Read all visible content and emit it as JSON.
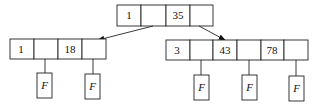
{
  "diagram": {
    "type": "tree",
    "root": {
      "keys": [
        "1",
        "",
        "35",
        ""
      ]
    },
    "children": [
      {
        "keys": [
          "1",
          "",
          "18",
          ""
        ],
        "leaf_pointers": [
          "F",
          "F"
        ]
      },
      {
        "keys": [
          "3",
          "",
          "43",
          "",
          "78",
          ""
        ],
        "leaf_pointers": [
          "F",
          "F",
          "F"
        ]
      }
    ]
  }
}
